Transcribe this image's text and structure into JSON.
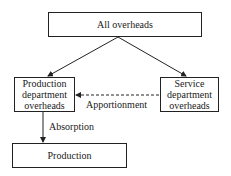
{
  "diagram": {
    "nodes": {
      "all_overheads": "All overheads",
      "production_dept": [
        "Production",
        "department",
        "overheads"
      ],
      "service_dept": [
        "Service",
        "department",
        "overheads"
      ],
      "production": "Production"
    },
    "edges": {
      "apportionment": "Apportionment",
      "absorption": "Absorption"
    },
    "colors": {
      "line": "#222222",
      "background": "#ffffff"
    }
  }
}
